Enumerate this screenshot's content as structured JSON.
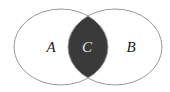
{
  "diagram": {
    "type": "venn",
    "sets": [
      {
        "id": "A",
        "label": "A"
      },
      {
        "id": "B",
        "label": "B"
      }
    ],
    "intersection": {
      "label": "C",
      "shaded": true
    },
    "colors": {
      "outline": "#9a9a9a",
      "intersection_fill": "#3a3a3a",
      "outer_label": "#222222",
      "inner_label": "#e8e8e8",
      "background": "#ffffff"
    }
  }
}
